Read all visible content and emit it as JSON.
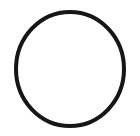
{
  "figure": {
    "kind": "line-drawing",
    "title": "",
    "caption": "",
    "background_color": "#ffffff",
    "canvas": {
      "width": 140,
      "height": 136
    },
    "shapes": [
      {
        "name": "circle-outline",
        "type": "ellipse",
        "center_x": 70,
        "center_y": 69,
        "radius_x": 54,
        "radius_y": 57,
        "stroke_color": "#161616",
        "stroke_width": 4,
        "fill": "none"
      }
    ]
  }
}
